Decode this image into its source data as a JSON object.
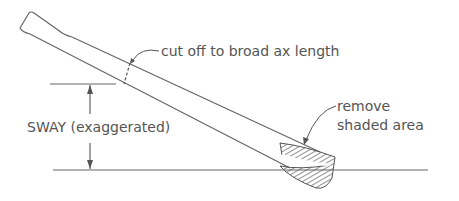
{
  "diagram": {
    "labels": {
      "cut_off": "cut off to broad ax length",
      "sway": "SWAY (exaggerated)",
      "remove_line1": "remove",
      "remove_line2": "shaded area"
    },
    "colors": {
      "ink": "#555555",
      "background": "#ffffff"
    }
  }
}
